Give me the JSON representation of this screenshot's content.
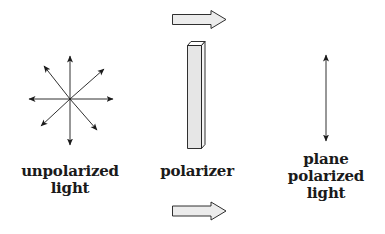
{
  "diagram": {
    "nodes": [
      {
        "id": "unpolarized",
        "label_lines": [
          "unpolarized",
          "light"
        ],
        "icon": "eight-direction-arrows-icon"
      },
      {
        "id": "polarizer",
        "label_lines": [
          "polarizer"
        ],
        "icon": "polarizer-bar-icon"
      },
      {
        "id": "plane_polarized",
        "label_lines": [
          "plane",
          "polarized",
          "light"
        ],
        "icon": "vertical-double-arrow-icon"
      }
    ],
    "flow_arrows": [
      {
        "id": "top",
        "direction": "right",
        "icon": "block-arrow-right-icon"
      },
      {
        "id": "bottom",
        "direction": "right",
        "icon": "block-arrow-right-icon"
      }
    ]
  },
  "colors": {
    "stroke": "#1a1a1a",
    "arrow_fill": "#ececec",
    "bar_front": "#e6e6e6",
    "bar_side": "#f4f4f4",
    "bar_top": "#ffffff",
    "background": "#ffffff"
  }
}
